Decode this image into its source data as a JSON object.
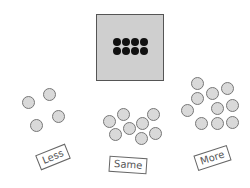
{
  "target": {
    "dot_count": 8,
    "rows": 2,
    "cols": 4,
    "box_color": "#cfcfcf"
  },
  "groups": [
    {
      "label": "Less",
      "count": 4
    },
    {
      "label": "Same",
      "count": 8
    },
    {
      "label": "More",
      "count": 10
    }
  ]
}
